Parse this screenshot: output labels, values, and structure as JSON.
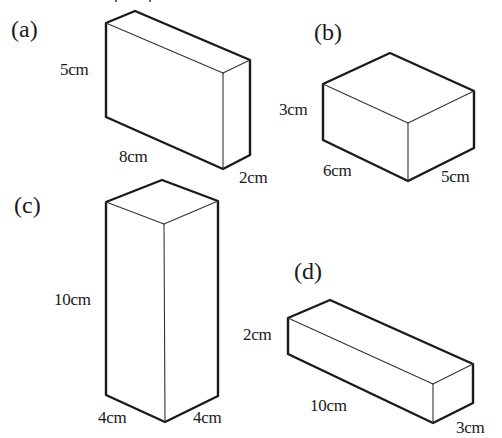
{
  "figure": {
    "colors": {
      "stroke": "#1a1a1a",
      "background": "#ffffff"
    },
    "boxes": [
      {
        "id": "a",
        "label": "(a)",
        "dims": {
          "height": "5cm",
          "length": "8cm",
          "width": "2cm"
        },
        "vertices": {
          "front_top_left": [
            106,
            23
          ],
          "back_top_left": [
            135,
            11
          ],
          "back_top_right": [
            250,
            60
          ],
          "front_top_right": [
            223,
            73
          ],
          "front_bottom_left": [
            106,
            117
          ],
          "front_bottom_right": [
            223,
            169
          ],
          "back_bottom_right": [
            250,
            155
          ]
        }
      },
      {
        "id": "b",
        "label": "(b)",
        "dims": {
          "height": "3cm",
          "length": "6cm",
          "width": "5cm"
        },
        "vertices": {
          "front_top_left": [
            323,
            84
          ],
          "back_top_left": [
            390,
            53
          ],
          "back_top_right": [
            474,
            91
          ],
          "front_top_right": [
            408,
            123
          ],
          "front_bottom_left": [
            323,
            140
          ],
          "front_bottom_right": [
            408,
            181
          ],
          "back_bottom_right": [
            474,
            148
          ]
        }
      },
      {
        "id": "c",
        "label": "(c)",
        "dims": {
          "height": "10cm",
          "length": "4cm",
          "width": "4cm"
        },
        "vertices": {
          "front_top_left": [
            106,
            202
          ],
          "back_top_left": [
            162,
            180
          ],
          "back_top_right": [
            218,
            201
          ],
          "front_top_right": [
            164,
            224
          ],
          "front_bottom_left": [
            106,
            395
          ],
          "front_bottom_right": [
            165,
            422
          ],
          "back_bottom_right": [
            218,
            396
          ]
        }
      },
      {
        "id": "d",
        "label": "(d)",
        "dims": {
          "height": "2cm",
          "length": "10cm",
          "width": "3cm"
        },
        "vertices": {
          "front_top_left": [
            288,
            318
          ],
          "back_top_left": [
            330,
            300
          ],
          "back_top_right": [
            473,
            364
          ],
          "front_top_right": [
            433,
            384
          ],
          "front_bottom_left": [
            288,
            354
          ],
          "front_bottom_right": [
            433,
            423
          ],
          "back_bottom_right": [
            473,
            403
          ]
        }
      }
    ]
  }
}
